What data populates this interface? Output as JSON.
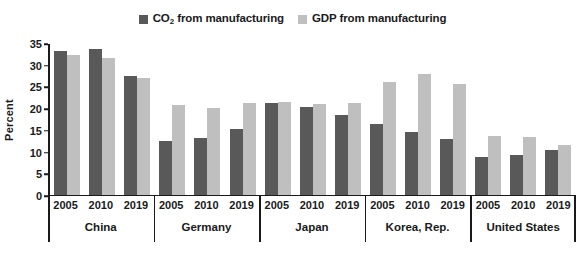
{
  "legend": {
    "entries": [
      {
        "label_pre": "CO",
        "label_sub": "2",
        "label_post": " from manufacturing",
        "color": "#595959",
        "name": "co2-from-manufacturing"
      },
      {
        "label_pre": "GDP from manufacturing",
        "label_sub": "",
        "label_post": "",
        "color": "#bfbfbf",
        "name": "gdp-from-manufacturing"
      }
    ]
  },
  "chart_data": {
    "type": "bar",
    "title": "",
    "subtitle": "",
    "xlabel": "",
    "ylabel": "Percent",
    "ylim": [
      0,
      35
    ],
    "yticks": [
      0,
      5,
      10,
      15,
      20,
      25,
      30,
      35
    ],
    "ytick_labels": [
      "0",
      "5",
      "10",
      "15",
      "20",
      "25",
      "30",
      "35"
    ],
    "grid": false,
    "legend_position": "top-center",
    "group_labels": [
      "China",
      "Germany",
      "Japan",
      "Korea, Rep.",
      "United States"
    ],
    "categories": [
      "2005",
      "2010",
      "2019"
    ],
    "series": [
      {
        "name": "CO2 from manufacturing",
        "color": "#595959",
        "values_by_group": {
          "China": [
            33.0,
            33.6,
            27.2
          ],
          "Germany": [
            12.3,
            13.0,
            15.1
          ],
          "Japan": [
            21.0,
            20.1,
            18.2
          ],
          "Korea, Rep.": [
            16.2,
            14.3,
            12.7
          ],
          "United States": [
            8.7,
            9.2,
            10.2
          ]
        }
      },
      {
        "name": "GDP from manufacturing",
        "color": "#bfbfbf",
        "values_by_group": {
          "China": [
            32.1,
            31.5,
            26.9
          ],
          "Germany": [
            20.5,
            19.9,
            21.0
          ],
          "Japan": [
            21.4,
            20.9,
            21.0
          ],
          "Korea, Rep.": [
            25.9,
            27.8,
            25.5
          ],
          "United States": [
            13.5,
            13.3,
            11.5
          ]
        }
      }
    ]
  },
  "axis": {
    "baseline_color": "#1a1a1a"
  }
}
